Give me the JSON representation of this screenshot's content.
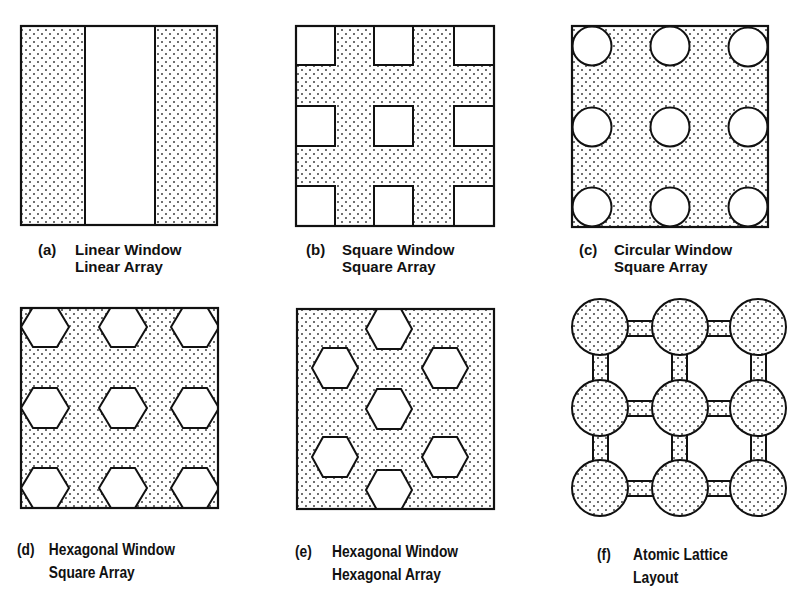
{
  "figure": {
    "colors": {
      "stroke": "#111111",
      "fill_background": "#ffffff",
      "dot_color": "#333333"
    },
    "panels": [
      {
        "id": "a",
        "tag": "(a)",
        "line1": "Linear Window",
        "line2": "Linear Array",
        "window_shape": "stripe",
        "array": "linear"
      },
      {
        "id": "b",
        "tag": "(b)",
        "line1": "Square Window",
        "line2": "Square Array",
        "window_shape": "square",
        "array": "square"
      },
      {
        "id": "c",
        "tag": "(c)",
        "line1": "Circular Window",
        "line2": "Square Array",
        "window_shape": "circle",
        "array": "square"
      },
      {
        "id": "d",
        "tag": "(d)",
        "line1": "Hexagonal Window",
        "line2": "Square Array",
        "window_shape": "hexagon",
        "array": "square"
      },
      {
        "id": "e",
        "tag": "(e)",
        "line1": "Hexagonal Window",
        "line2": "Hexagonal Array",
        "window_shape": "hexagon",
        "array": "hexagonal"
      },
      {
        "id": "f",
        "tag": "(f)",
        "line1": "Atomic Lattice",
        "line2": "Layout",
        "window_shape": "circle-node",
        "array": "lattice"
      }
    ]
  }
}
